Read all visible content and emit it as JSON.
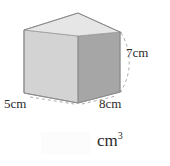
{
  "figure": {
    "shape_name": "cuboid",
    "colors": {
      "top_face": "#e3e3e3",
      "left_face": "#d2d2d2",
      "right_face": "#a6a6a6",
      "edge": "#8c8c8c",
      "hidden_edge": "#b9b9b9",
      "leader_line": "#9a9a9a",
      "text": "#2b2b2b"
    },
    "labels": {
      "depth": "5cm",
      "width": "8cm",
      "height": "7cm"
    }
  },
  "answer": {
    "value": "",
    "placeholder": "",
    "unit_base": "cm",
    "unit_exponent": "3"
  }
}
